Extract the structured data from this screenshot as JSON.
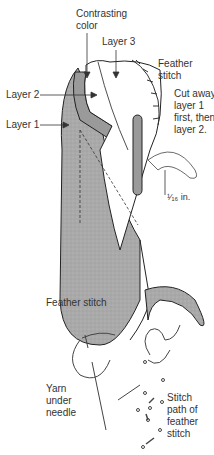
{
  "diagram": {
    "top_figure": {
      "labels": {
        "contrasting_color": "Contrasting\ncolor",
        "layer3": "Layer 3",
        "feather_stitch": "Feather\nstitch",
        "layer2": "Layer 2",
        "layer1": "Layer 1",
        "cut_away": "Cut away\nlayer 1\nfirst, then\nlayer 2.",
        "measurement": "¹⁄₁₆ in."
      },
      "colors": {
        "fabric_gray": "#a8a8a8",
        "outline": "#222222",
        "white_layer": "#ffffff"
      }
    },
    "bottom_figure": {
      "title": "Feather stitch",
      "labels": {
        "yarn_under_needle": "Yarn\nunder\nneedle",
        "stitch_path": "Stitch\npath of\nfeather\nstitch"
      }
    }
  }
}
